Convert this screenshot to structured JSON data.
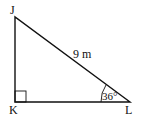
{
  "diagram": {
    "type": "right-triangle",
    "vertices": {
      "J": {
        "label": "J"
      },
      "K": {
        "label": "K"
      },
      "L": {
        "label": "L"
      }
    },
    "hypotenuse_label": "9 m",
    "angle_label": "36°",
    "right_angle_at": "K",
    "colors": {
      "stroke": "#111111",
      "background": "#ffffff"
    }
  }
}
